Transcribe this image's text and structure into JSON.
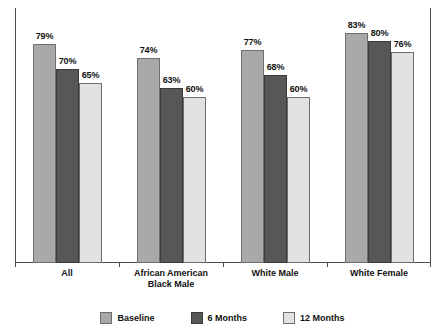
{
  "chart_data": {
    "type": "bar",
    "title": "",
    "subtitle": "",
    "xlabel": "",
    "ylabel": "",
    "ylim": [
      0,
      100
    ],
    "grid": false,
    "legend_position": "bottom-center",
    "value_suffix": "%",
    "categories": [
      "All",
      "African American Black Male",
      "White Male",
      "White Female"
    ],
    "category_lines": [
      [
        "All"
      ],
      [
        "African American",
        "Black Male"
      ],
      [
        "White Male"
      ],
      [
        "White Female"
      ]
    ],
    "series": [
      {
        "name": "Baseline",
        "color": "#a9a9a9",
        "values": [
          79,
          74,
          77,
          83
        ],
        "labels": [
          "79%",
          "74%",
          "77%",
          "83%"
        ]
      },
      {
        "name": "6 Months",
        "color": "#575757",
        "values": [
          70,
          63,
          68,
          80
        ],
        "labels": [
          "70%",
          "63%",
          "68%",
          "80%"
        ]
      },
      {
        "name": "12 Months",
        "color": "#e2e2e2",
        "values": [
          65,
          60,
          60,
          76
        ],
        "labels": [
          "65%",
          "60%",
          "60%",
          "76%"
        ]
      }
    ]
  },
  "legend": {
    "items": [
      {
        "label": "Baseline",
        "color": "#a9a9a9"
      },
      {
        "label": "6 Months",
        "color": "#575757"
      },
      {
        "label": "12 Months",
        "color": "#e2e2e2"
      }
    ]
  },
  "axes": {
    "axis_color": "#4d4d4d",
    "max_value": 92
  }
}
